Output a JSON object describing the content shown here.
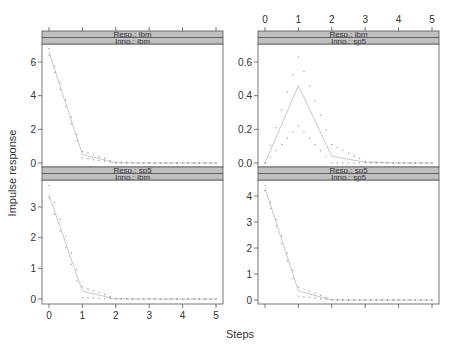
{
  "chart_data": {
    "type": "line",
    "title": "",
    "xlabel": "Steps",
    "ylabel": "Impulse response",
    "x": [
      0,
      1,
      2,
      3,
      4,
      5
    ],
    "x_ticks": [
      "0",
      "1",
      "2",
      "3",
      "4",
      "5"
    ],
    "xlim": [
      0,
      5
    ],
    "grid": false,
    "legend": "none",
    "panels": [
      {
        "position": "top-left",
        "strip": [
          "Resp.: ibm",
          "Inno.: ibm"
        ],
        "ylim": [
          0,
          7
        ],
        "y_ticks": [
          0,
          2,
          4,
          6
        ],
        "y_tick_labels": [
          "0",
          "2",
          "4",
          "6"
        ],
        "response": [
          6.6,
          0.5,
          0.02,
          0.0,
          0.0,
          0.0
        ],
        "lower_bound": [
          6.4,
          0.3,
          0.0,
          0.0,
          0.0,
          0.0
        ],
        "upper_bound": [
          6.8,
          0.7,
          0.05,
          0.0,
          0.0,
          0.0
        ]
      },
      {
        "position": "top-right",
        "strip": [
          "Resp.: ibm",
          "Inno.: sp5"
        ],
        "ylim": [
          0,
          0.7
        ],
        "y_ticks": [
          0.0,
          0.2,
          0.4,
          0.6
        ],
        "y_tick_labels": [
          "0.0",
          "0.2",
          "0.4",
          "0.6"
        ],
        "response": [
          0.0,
          0.46,
          0.04,
          0.005,
          0.0,
          0.0
        ],
        "lower_bound": [
          0.0,
          0.22,
          0.0,
          0.0,
          0.0,
          0.0
        ],
        "upper_bound": [
          0.0,
          0.63,
          0.11,
          0.01,
          0.0,
          0.0
        ]
      },
      {
        "position": "bottom-left",
        "strip": [
          "Resp.: sp5",
          "Inno.: ibm"
        ],
        "ylim": [
          0,
          3.8
        ],
        "y_ticks": [
          0,
          1,
          2,
          3
        ],
        "y_tick_labels": [
          "0",
          "1",
          "2",
          "3"
        ],
        "response": [
          3.4,
          0.25,
          0.0,
          0.0,
          0.0,
          0.0
        ],
        "lower_bound": [
          3.3,
          0.05,
          0.0,
          0.0,
          0.0,
          0.0
        ],
        "upper_bound": [
          3.7,
          0.4,
          0.02,
          0.0,
          0.0,
          0.0
        ]
      },
      {
        "position": "bottom-right",
        "strip": [
          "Resp.: sp5",
          "Inno.: sp5"
        ],
        "ylim": [
          0,
          4.6
        ],
        "y_ticks": [
          0,
          1,
          2,
          3,
          4
        ],
        "y_tick_labels": [
          "0",
          "1",
          "2",
          "3",
          "4"
        ],
        "response": [
          4.3,
          0.35,
          0.0,
          0.0,
          0.0,
          0.0
        ],
        "lower_bound": [
          4.2,
          0.15,
          0.0,
          0.0,
          0.0,
          0.0
        ],
        "upper_bound": [
          4.4,
          0.5,
          0.02,
          0.0,
          0.0,
          0.0
        ]
      }
    ]
  },
  "labels": {
    "xlabel": "Steps",
    "ylabel": "Impulse response"
  },
  "colors": {
    "line": "#c8c8c8",
    "points": "#999999",
    "strip_fill": "#c0c0c0",
    "axis": "#555555",
    "text": "#333333"
  }
}
